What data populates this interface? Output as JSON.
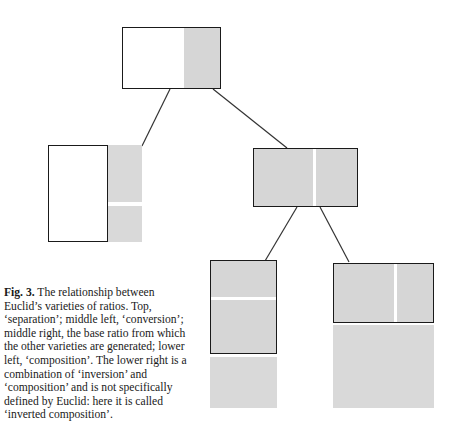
{
  "figure": {
    "label": "Fig. 3.",
    "caption_text": "The relationship between Euclid’s varieties of ratios. Top, ‘separation’; middle left, ‘conversion’; middle right, the base ratio from which the other varieties are generated; lower left, ‘composition’. The lower right is a combination of ‘inversion’ and ‘composition’ and is not specifically defined by Euclid: here it is called ‘inverted composition’."
  },
  "colors": {
    "grey_fill": "#d6d6d6",
    "loose_grey_fill": "#d9d9d9",
    "outline": "#1a1a1a",
    "background": "#ffffff",
    "divider": "#ffffff"
  },
  "diagram": {
    "nodes": [
      {
        "id": "top",
        "name": "separation",
        "role": "Top, 'separation'",
        "x": 122,
        "y": 27,
        "width": 99,
        "height": 62,
        "framed": true,
        "segments": [
          {
            "fill": "white",
            "x": 0,
            "y": 0,
            "width": 62,
            "height": 62
          },
          {
            "fill": "grey",
            "x": 62,
            "y": 0,
            "width": 37,
            "height": 62
          }
        ]
      },
      {
        "id": "middle-left",
        "name": "conversion",
        "role": "middle left, 'conversion'",
        "x": 48,
        "y": 145,
        "width": 60,
        "height": 97,
        "framed": true,
        "segments": [
          {
            "fill": "white",
            "x": 0,
            "y": 0,
            "width": 60,
            "height": 97
          }
        ],
        "attached_grey": [
          {
            "x": 108,
            "y": 145,
            "width": 34,
            "height": 57
          },
          {
            "x": 108,
            "y": 206,
            "width": 34,
            "height": 36
          }
        ]
      },
      {
        "id": "middle-right",
        "name": "base-ratio",
        "role": "middle right, the base ratio from which the other varieties are generated",
        "x": 253,
        "y": 148,
        "width": 105,
        "height": 59,
        "framed": true,
        "segments": [
          {
            "fill": "grey",
            "x": 0,
            "y": 0,
            "width": 105,
            "height": 59
          }
        ],
        "dividers": [
          {
            "orient": "vertical",
            "pos": 61
          }
        ]
      },
      {
        "id": "lower-left",
        "name": "composition",
        "role": "lower left, 'composition'",
        "x": 210,
        "y": 260,
        "width": 67,
        "height": 94,
        "framed": true,
        "segments": [
          {
            "fill": "grey",
            "x": 0,
            "y": 0,
            "width": 67,
            "height": 94
          }
        ],
        "dividers": [
          {
            "orient": "horizontal",
            "pos": 38
          }
        ],
        "attached_grey": [
          {
            "x": 210,
            "y": 357,
            "width": 67,
            "height": 51
          }
        ]
      },
      {
        "id": "lower-right",
        "name": "inverted-composition",
        "role": "lower right, combination of 'inversion' and 'composition', called 'inverted composition'",
        "x": 333,
        "y": 263,
        "width": 101,
        "height": 60,
        "framed": true,
        "segments": [
          {
            "fill": "grey",
            "x": 0,
            "y": 0,
            "width": 101,
            "height": 60
          }
        ],
        "dividers": [
          {
            "orient": "vertical",
            "pos": 62
          }
        ],
        "attached_grey": [
          {
            "x": 333,
            "y": 325,
            "width": 101,
            "height": 83
          }
        ]
      }
    ],
    "connectors": [
      {
        "from": "top",
        "to": "middle-left",
        "x1": 170,
        "y1": 89,
        "x2": 142,
        "y2": 146
      },
      {
        "from": "top",
        "to": "middle-right",
        "x1": 213,
        "y1": 89,
        "x2": 287,
        "y2": 148
      },
      {
        "from": "middle-right",
        "to": "lower-left",
        "x1": 297,
        "y1": 207,
        "x2": 265,
        "y2": 261
      },
      {
        "from": "middle-right",
        "to": "lower-right",
        "x1": 320,
        "y1": 207,
        "x2": 349,
        "y2": 262
      }
    ]
  }
}
